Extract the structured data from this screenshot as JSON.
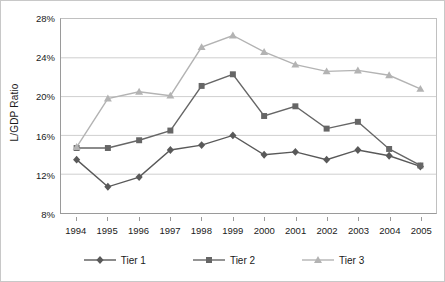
{
  "chart_data": {
    "type": "line",
    "title": "",
    "xlabel": "",
    "ylabel": "L/GDP Ratio",
    "x": [
      1994,
      1995,
      1996,
      1997,
      1998,
      1999,
      2000,
      2001,
      2002,
      2003,
      2004,
      2005
    ],
    "categories": [
      "1994",
      "1995",
      "1996",
      "1997",
      "1998",
      "1999",
      "2000",
      "2001",
      "2002",
      "2003",
      "2004",
      "2005"
    ],
    "ylim": [
      8,
      28
    ],
    "yticks": [
      8,
      12,
      16,
      20,
      24,
      28
    ],
    "ytick_labels": [
      "8%",
      "12%",
      "16%",
      "20%",
      "24%",
      "28%"
    ],
    "grid": true,
    "legend_position": "bottom",
    "series": [
      {
        "name": "Tier 1",
        "color": "#595959",
        "marker": "diamond",
        "values": [
          13.5,
          10.7,
          11.7,
          14.5,
          15.0,
          16.0,
          14.0,
          14.3,
          13.5,
          14.5,
          13.9,
          12.8
        ]
      },
      {
        "name": "Tier 2",
        "color": "#666666",
        "marker": "square",
        "values": [
          14.7,
          14.7,
          15.5,
          16.5,
          21.1,
          22.3,
          18.0,
          19.0,
          16.7,
          17.4,
          14.6,
          12.9
        ]
      },
      {
        "name": "Tier 3",
        "color": "#b3b3b3",
        "marker": "triangle",
        "values": [
          14.8,
          19.8,
          20.5,
          20.1,
          25.1,
          26.3,
          24.6,
          23.3,
          22.6,
          22.7,
          22.2,
          20.8
        ]
      }
    ]
  },
  "legend": {
    "items": [
      {
        "label": "Tier 1"
      },
      {
        "label": "Tier 2"
      },
      {
        "label": "Tier 3"
      }
    ]
  },
  "axis": {
    "y_title": "L/GDP Ratio"
  }
}
